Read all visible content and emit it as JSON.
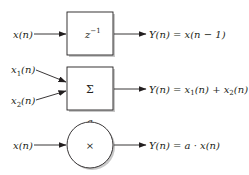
{
  "diagram": {
    "type": "signal-flow-building-blocks",
    "blocks": [
      {
        "id": "delay",
        "shape": "rectangle",
        "symbol_base": "z",
        "symbol_sup": "−1",
        "inputs": [
          {
            "label": "x(n)"
          }
        ],
        "output": {
          "label": "Y(n) = x(n − 1)"
        }
      },
      {
        "id": "adder",
        "shape": "rectangle",
        "symbol": "Σ",
        "inputs": [
          {
            "base": "x",
            "sub": "1",
            "tail": "(n)"
          },
          {
            "base": "x",
            "sub": "2",
            "tail": "(n)"
          }
        ],
        "output": {
          "prefix": "Y(n) = x",
          "sub1": "1",
          "mid": "(n) + x",
          "sub2": "2",
          "tail": "(n)"
        }
      },
      {
        "id": "multiplier",
        "shape": "circle",
        "symbol": "×",
        "coefficient": "a",
        "inputs": [
          {
            "label": "x(n)"
          }
        ],
        "output": {
          "label": "Y(n) = a · x(n)"
        }
      }
    ],
    "colors": {
      "ink": "#231f20",
      "shadow": "#9a9a9a",
      "background": "#ffffff"
    }
  }
}
